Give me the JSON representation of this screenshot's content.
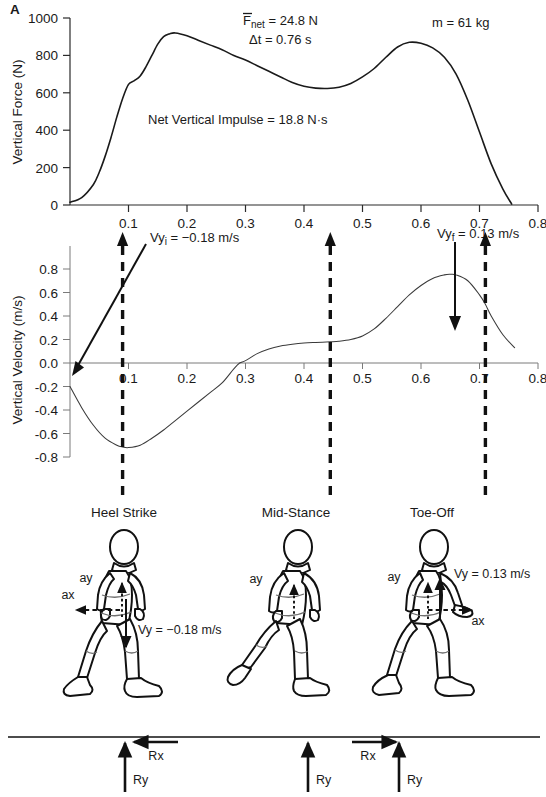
{
  "figure": {
    "title_marker": "A"
  },
  "force_panel": {
    "ylabel": "Vertical Force (N)",
    "yticks": [
      "0",
      "200",
      "400",
      "600",
      "800",
      "1000"
    ],
    "xticks": [
      "0.1",
      "0.2",
      "0.3",
      "0.4",
      "0.5",
      "0.6",
      "0.7",
      "0.8"
    ],
    "annotations": {
      "fnet": "Fnet = 24.8 N",
      "fnet_symbol": "F",
      "fnet_sub": "net",
      "fnet_value": " = 24.8 N",
      "dt": "Δt = 0.76 s",
      "mass": "m = 61 kg",
      "impulse": "Net Vertical Impulse = 18.8 N·s"
    }
  },
  "velocity_panel": {
    "ylabel": "Vertical Velocity (m/s)",
    "yticks": [
      "-0.8",
      "-0.6",
      "-0.4",
      "-0.2",
      "0.0",
      "0.2",
      "0.4",
      "0.6",
      "0.8"
    ],
    "xticks": [
      "0.1",
      "0.2",
      "0.3",
      "0.4",
      "0.5",
      "0.6",
      "0.7",
      "0.8"
    ],
    "annotations": {
      "vyi_symbol": "Vy",
      "vyi_sub": "i",
      "vyi_value": " = −0.18 m/s",
      "vyf_symbol": "Vy",
      "vyf_sub": "f",
      "vyf_value": " = 0.13 m/s"
    }
  },
  "gait_panel": {
    "phases": [
      {
        "label": "Heel Strike",
        "ay_label": "ay",
        "ax_label": "ax",
        "vy_label": "Vy = −0.18 m/s",
        "rx_label": "Rx",
        "ry_label": "Ry"
      },
      {
        "label": "Mid-Stance",
        "ay_label": "ay",
        "ry_label": "Ry"
      },
      {
        "label": "Toe-Off",
        "ay_label": "ay",
        "ax_label": "ax",
        "vy_label": "Vy = 0.13 m/s",
        "rx_label": "Rx",
        "ry_label": "Ry"
      }
    ]
  },
  "chart_data": [
    {
      "type": "line",
      "title": "Vertical Ground Reaction Force",
      "xlabel": "",
      "ylabel": "Vertical Force (N)",
      "xlim": [
        0.0,
        0.8
      ],
      "ylim": [
        0,
        1000
      ],
      "grid": false,
      "legend": "none",
      "x": [
        0.0,
        0.02,
        0.04,
        0.05,
        0.06,
        0.07,
        0.08,
        0.09,
        0.1,
        0.11,
        0.12,
        0.13,
        0.14,
        0.15,
        0.16,
        0.17,
        0.18,
        0.2,
        0.22,
        0.24,
        0.26,
        0.28,
        0.3,
        0.32,
        0.34,
        0.36,
        0.38,
        0.4,
        0.42,
        0.44,
        0.46,
        0.48,
        0.5,
        0.52,
        0.54,
        0.56,
        0.58,
        0.6,
        0.62,
        0.64,
        0.66,
        0.68,
        0.7,
        0.72,
        0.74,
        0.755
      ],
      "y": [
        15,
        40,
        110,
        175,
        260,
        360,
        470,
        570,
        645,
        665,
        690,
        740,
        800,
        860,
        900,
        915,
        920,
        905,
        880,
        855,
        830,
        800,
        775,
        745,
        715,
        685,
        655,
        635,
        625,
        623,
        630,
        650,
        685,
        730,
        790,
        845,
        870,
        865,
        840,
        790,
        700,
        560,
        390,
        220,
        85,
        5
      ],
      "annotations": [
        "Fnet = 24.8 N",
        "Δt = 0.76 s",
        "m = 61 kg",
        "Net Vertical Impulse = 18.8 N·s"
      ],
      "markers": {
        "heel_strike_t": 0.09,
        "mid_stance_t": 0.445,
        "toe_off_t": 0.71
      }
    },
    {
      "type": "line",
      "title": "Vertical Velocity of Center of Mass",
      "xlabel": "",
      "ylabel": "Vertical Velocity (m/s)",
      "xlim": [
        0.0,
        0.8
      ],
      "ylim": [
        -0.8,
        0.8
      ],
      "grid": false,
      "legend": "none",
      "x": [
        0.0,
        0.02,
        0.04,
        0.06,
        0.08,
        0.09,
        0.1,
        0.12,
        0.14,
        0.16,
        0.18,
        0.2,
        0.22,
        0.24,
        0.26,
        0.28,
        0.29,
        0.3,
        0.32,
        0.34,
        0.36,
        0.38,
        0.4,
        0.42,
        0.445,
        0.46,
        0.48,
        0.5,
        0.52,
        0.54,
        0.56,
        0.58,
        0.6,
        0.62,
        0.64,
        0.65,
        0.66,
        0.68,
        0.7,
        0.71,
        0.72,
        0.74,
        0.76
      ],
      "y": [
        -0.2,
        -0.38,
        -0.53,
        -0.64,
        -0.7,
        -0.715,
        -0.72,
        -0.7,
        -0.64,
        -0.57,
        -0.49,
        -0.41,
        -0.33,
        -0.25,
        -0.17,
        -0.05,
        0.0,
        0.02,
        0.08,
        0.12,
        0.145,
        0.16,
        0.17,
        0.175,
        0.18,
        0.185,
        0.2,
        0.23,
        0.29,
        0.38,
        0.48,
        0.58,
        0.66,
        0.72,
        0.75,
        0.755,
        0.75,
        0.7,
        0.58,
        0.5,
        0.4,
        0.24,
        0.13
      ],
      "annotations": [
        "Vyi = −0.18 m/s",
        "Vyf = 0.13 m/s"
      ],
      "markers": {
        "heel_strike_t": 0.09,
        "mid_stance_t": 0.445,
        "toe_off_t": 0.71
      }
    }
  ]
}
